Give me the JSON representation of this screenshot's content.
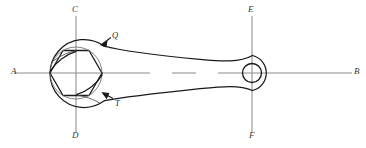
{
  "figure": {
    "background_color": "#ffffff",
    "width": 366,
    "height": 148
  },
  "colors": {
    "outline": "#1a1a1a",
    "centerline": "#8c8c8c",
    "hidden_edge": "#6e6e6e",
    "label_text": "#2f2f2f",
    "background": "#ffffff"
  },
  "axes": {
    "horizontal": {
      "name": "A-B",
      "y": 73,
      "x_start": 14,
      "x_end": 352,
      "left_label": "A",
      "right_label": "B",
      "style": "center-line",
      "dash_gaps": [
        [
          150,
          172
        ],
        [
          196,
          218
        ]
      ]
    },
    "vertical_left": {
      "name": "C-D",
      "x": 76,
      "y_start": 16,
      "y_end": 132,
      "top_label": "C",
      "bottom_label": "D",
      "style": "center-line"
    },
    "vertical_right": {
      "name": "E-F",
      "x": 252,
      "y_start": 16,
      "y_end": 132,
      "top_label": "E",
      "bottom_label": "F",
      "style": "center-line"
    }
  },
  "labels": {
    "A": {
      "text": "A",
      "x": 11,
      "y": 68
    },
    "B": {
      "text": "B",
      "x": 355,
      "y": 68
    },
    "C": {
      "text": "C",
      "x": 72,
      "y": 6
    },
    "D": {
      "text": "D",
      "x": 72,
      "y": 131
    },
    "E": {
      "text": "E",
      "x": 248,
      "y": 6
    },
    "F": {
      "text": "F",
      "x": 248,
      "y": 131
    },
    "Q": {
      "text": "Q",
      "x": 112,
      "y": 35
    },
    "T": {
      "text": "T",
      "x": 114,
      "y": 100
    }
  },
  "geometry": {
    "wrench_head": {
      "center_x": 76,
      "center_y": 73,
      "outer_boss_radius": 34,
      "nut_circumscribed_radius": 26,
      "hex_across_corners": 52,
      "hex_rotation_deg": 0,
      "jaw_opening_labels": [
        "Q",
        "T"
      ]
    },
    "ring_end": {
      "center_x": 252,
      "center_y": 73,
      "hole_radius": 9.5,
      "boss_radius": 18
    },
    "handle": {
      "from_x": 104,
      "to_x": 252,
      "width_at_head": 56,
      "width_at_ring": 30,
      "taper": "linear"
    }
  },
  "leaders": {
    "Q": {
      "from_x": 110,
      "from_y": 38,
      "to_x": 101,
      "to_y": 44
    },
    "T": {
      "from_x": 112,
      "from_y": 99,
      "to_x": 103,
      "to_y": 94
    }
  }
}
